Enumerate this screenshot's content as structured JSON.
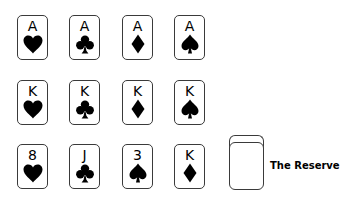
{
  "game": {
    "rows": [
      {
        "name": "row-aces",
        "top": 15,
        "cards": [
          {
            "rank": "A",
            "suit": "hearts",
            "left": 17
          },
          {
            "rank": "A",
            "suit": "clubs",
            "left": 69
          },
          {
            "rank": "A",
            "suit": "diamonds",
            "left": 122
          },
          {
            "rank": "A",
            "suit": "spades",
            "left": 174
          }
        ]
      },
      {
        "name": "row-kings",
        "top": 80,
        "cards": [
          {
            "rank": "K",
            "suit": "hearts",
            "left": 17
          },
          {
            "rank": "K",
            "suit": "clubs",
            "left": 69
          },
          {
            "rank": "K",
            "suit": "diamonds",
            "left": 122
          },
          {
            "rank": "K",
            "suit": "spades",
            "left": 174
          }
        ]
      },
      {
        "name": "row-tableau",
        "top": 144,
        "cards": [
          {
            "rank": "8",
            "suit": "hearts",
            "left": 17
          },
          {
            "rank": "J",
            "suit": "clubs",
            "left": 69
          },
          {
            "rank": "3",
            "suit": "spades",
            "left": 122
          },
          {
            "rank": "K",
            "suit": "diamonds",
            "left": 174
          }
        ]
      }
    ],
    "reserve": {
      "label": "The Reserve"
    }
  },
  "colors": {
    "card_border": "#3a3a3a",
    "suit": "#000000",
    "background": "#ffffff"
  }
}
